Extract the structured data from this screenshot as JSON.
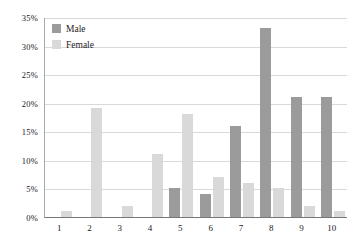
{
  "chart_data": {
    "type": "bar",
    "title": "",
    "xlabel": "",
    "ylabel": "",
    "categories": [
      "1",
      "2",
      "3",
      "4",
      "5",
      "6",
      "7",
      "8",
      "9",
      "10"
    ],
    "series": [
      {
        "name": "Male",
        "color": "#9b9b9b",
        "values": [
          0,
          0,
          0,
          0,
          5,
          4,
          16,
          33,
          21,
          21
        ]
      },
      {
        "name": "Female",
        "color": "#d9d9d9",
        "values": [
          1,
          19,
          2,
          11,
          18,
          7,
          6,
          5,
          2,
          1
        ]
      }
    ],
    "ylim": [
      0,
      35
    ],
    "ytick_values": [
      0,
      5,
      10,
      15,
      20,
      25,
      30,
      35
    ],
    "ytick_labels": [
      "0%",
      "5%",
      "10%",
      "15%",
      "20%",
      "25%",
      "30%",
      "35%"
    ],
    "grid": true,
    "legend_position": "top-left",
    "value_suffix": "%"
  },
  "legend": {
    "items": [
      {
        "label": "Male",
        "swatch": "male-swatch"
      },
      {
        "label": "Female",
        "swatch": "female-swatch"
      }
    ]
  }
}
